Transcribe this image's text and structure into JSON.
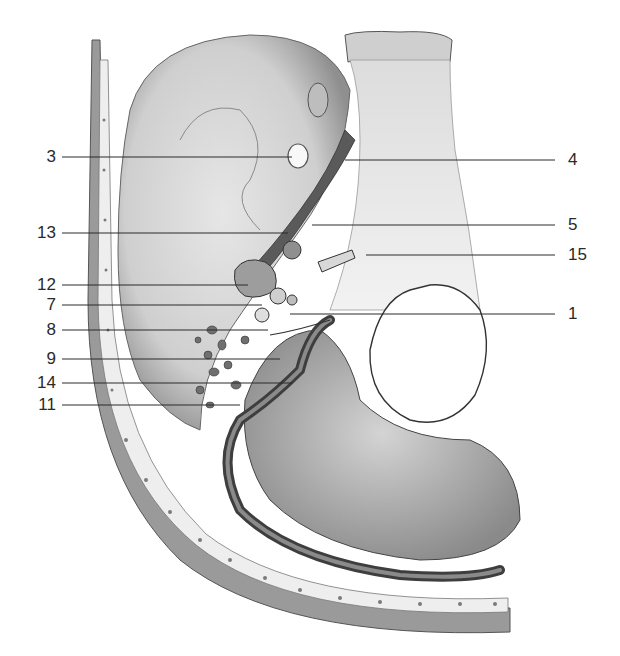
{
  "figure": {
    "type": "anatomical-illustration",
    "colors": {
      "background": "#ffffff",
      "ink": "#2a2a2a",
      "bone_light": "#e4e4e4",
      "bone_mid": "#b8b8b8",
      "bone_dark": "#6e6e6e"
    }
  },
  "labels": {
    "left": [
      {
        "text": "3",
        "y": 157,
        "tx": 292
      },
      {
        "text": "13",
        "y": 233,
        "tx": 288
      },
      {
        "text": "12",
        "y": 285,
        "tx": 248
      },
      {
        "text": "7",
        "y": 305,
        "tx": 262
      },
      {
        "text": "8",
        "y": 330,
        "tx": 268
      },
      {
        "text": "9",
        "y": 359,
        "tx": 280
      },
      {
        "text": "14",
        "y": 383,
        "tx": 292
      },
      {
        "text": "11",
        "y": 405,
        "tx": 240
      }
    ],
    "right": [
      {
        "text": "4",
        "y": 160,
        "tx": 345
      },
      {
        "text": "5",
        "y": 225,
        "tx": 312
      },
      {
        "text": "15",
        "y": 255,
        "tx": 366
      },
      {
        "text": "1",
        "y": 314,
        "tx": 290
      }
    ]
  }
}
